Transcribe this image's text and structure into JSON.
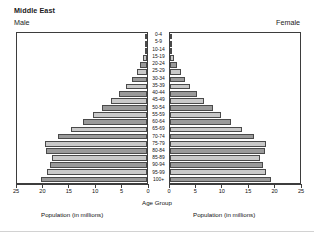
{
  "header": {
    "title": "Middle East",
    "male_label": "Male",
    "female_label": "Female"
  },
  "axis_titles": {
    "center": "Age Group",
    "left_population": "Population (in millions)",
    "right_population": "Population (in millions)"
  },
  "colors": {
    "bar_dark": "#9a9a9a",
    "bar_light": "#c9c9c9",
    "bar_border": "#4a4a4a",
    "axis": "#3d3d3d",
    "text": "#111111",
    "background": "#ffffff"
  },
  "chart_data": {
    "type": "bar",
    "subtype": "population-pyramid",
    "title": "Middle East",
    "xlabel": "Population (in millions)",
    "ylabel": "Age Group",
    "grid": false,
    "legend_position": "none",
    "xlim_left": [
      25,
      0
    ],
    "xlim_right": [
      0,
      25
    ],
    "left_ticks": [
      25,
      20,
      15,
      10,
      5,
      0
    ],
    "right_ticks": [
      0,
      5,
      10,
      15,
      20,
      25
    ],
    "categories": [
      "0-4",
      "5-9",
      "10-14",
      "15-19",
      "20-24",
      "25-29",
      "30-34",
      "35-39",
      "40-44",
      "45-49",
      "50-54",
      "55-59",
      "60-64",
      "65-69",
      "70-74",
      "75-79",
      "80-84",
      "85-89",
      "90-94",
      "95-99",
      "100+"
    ],
    "series": [
      {
        "name": "Male",
        "side": "left",
        "values": [
          20.4,
          19.3,
          18.6,
          18.2,
          19.5,
          19.6,
          17.2,
          14.7,
          12.4,
          10.4,
          8.6,
          6.9,
          5.4,
          4.0,
          2.9,
          2.0,
          1.3,
          0.7,
          0.3,
          0.1,
          0.03
        ]
      },
      {
        "name": "Female",
        "side": "right",
        "values": [
          19.5,
          18.5,
          17.8,
          17.4,
          18.3,
          18.4,
          16.2,
          13.9,
          11.8,
          9.9,
          8.2,
          6.6,
          5.2,
          3.9,
          2.9,
          2.1,
          1.4,
          0.8,
          0.35,
          0.12,
          0.04
        ]
      }
    ]
  }
}
